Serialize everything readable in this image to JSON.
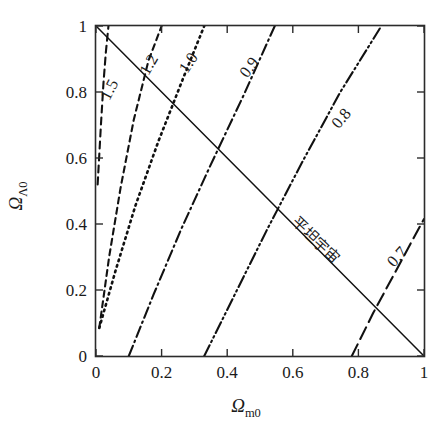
{
  "chart_data": {
    "type": "line",
    "title": "",
    "xlabel": "Ωm0",
    "ylabel": "ΩΛ0",
    "xlabel_symbol": "Ω",
    "xlabel_sub": "m0",
    "ylabel_symbol": "Ω",
    "ylabel_sub": "Λ0",
    "xlim": [
      0,
      1
    ],
    "ylim": [
      0,
      1
    ],
    "grid": false,
    "legend": "none",
    "xticks": [
      "0",
      "0.2",
      "0.4",
      "0.6",
      "0.8",
      "1"
    ],
    "xtick_values": [
      0,
      0.2,
      0.4,
      0.6,
      0.8,
      1
    ],
    "yticks": [
      "0",
      "0.2",
      "0.4",
      "0.6",
      "0.8",
      "1"
    ],
    "ytick_values": [
      0,
      0.2,
      0.4,
      0.6,
      0.8,
      1
    ],
    "annotations": [
      {
        "text": "平坦宇宙",
        "x": 0.66,
        "y": 0.34,
        "rotation": 43
      }
    ],
    "series": [
      {
        "name": "1.5",
        "label": "1.5",
        "style": "dash",
        "label_x": 0.055,
        "label_y": 0.8,
        "label_rotation": -63,
        "points": [
          [
            0.005,
            0.52
          ],
          [
            0.015,
            0.7
          ],
          [
            0.023,
            0.83
          ],
          [
            0.03,
            0.92
          ],
          [
            0.038,
            1.0
          ]
        ]
      },
      {
        "name": "1.2",
        "label": "1.2",
        "style": "dash2",
        "label_x": 0.175,
        "label_y": 0.875,
        "label_rotation": -60,
        "points": [
          [
            0.01,
            0.085
          ],
          [
            0.04,
            0.3
          ],
          [
            0.075,
            0.51
          ],
          [
            0.115,
            0.715
          ],
          [
            0.16,
            0.895
          ],
          [
            0.2,
            1.0
          ]
        ]
      },
      {
        "name": "1.0",
        "label": "1.0",
        "style": "dot",
        "label_x": 0.295,
        "label_y": 0.88,
        "label_rotation": -57,
        "points": [
          [
            0.01,
            0.085
          ],
          [
            0.06,
            0.26
          ],
          [
            0.12,
            0.455
          ],
          [
            0.19,
            0.65
          ],
          [
            0.265,
            0.84
          ],
          [
            0.33,
            1.0
          ]
        ]
      },
      {
        "name": "0.9",
        "label": "0.9",
        "style": "dashdot",
        "label_x": 0.48,
        "label_y": 0.865,
        "label_rotation": -53,
        "points": [
          [
            0.1,
            0.0
          ],
          [
            0.175,
            0.185
          ],
          [
            0.26,
            0.385
          ],
          [
            0.35,
            0.58
          ],
          [
            0.45,
            0.79
          ],
          [
            0.545,
            1.0
          ]
        ]
      },
      {
        "name": "0.8",
        "label": "0.8",
        "style": "dashdotdot",
        "label_x": 0.76,
        "label_y": 0.71,
        "label_rotation": -50,
        "points": [
          [
            0.33,
            0.0
          ],
          [
            0.42,
            0.18
          ],
          [
            0.52,
            0.38
          ],
          [
            0.63,
            0.59
          ],
          [
            0.745,
            0.8
          ],
          [
            0.87,
            1.0
          ]
        ]
      },
      {
        "name": "0.7",
        "label": "0.7",
        "style": "longdash",
        "label_x": 0.93,
        "label_y": 0.29,
        "label_rotation": -48,
        "points": [
          [
            0.78,
            0.0
          ],
          [
            0.845,
            0.13
          ],
          [
            0.91,
            0.25
          ],
          [
            0.975,
            0.37
          ],
          [
            1.0,
            0.415
          ]
        ]
      },
      {
        "name": "flat-universe",
        "label": "平坦宇宙",
        "style": "solid",
        "label_x": 0.66,
        "label_y": 0.34,
        "label_rotation": 43,
        "points": [
          [
            0.0,
            1.0
          ],
          [
            1.0,
            0.0
          ]
        ]
      }
    ]
  }
}
